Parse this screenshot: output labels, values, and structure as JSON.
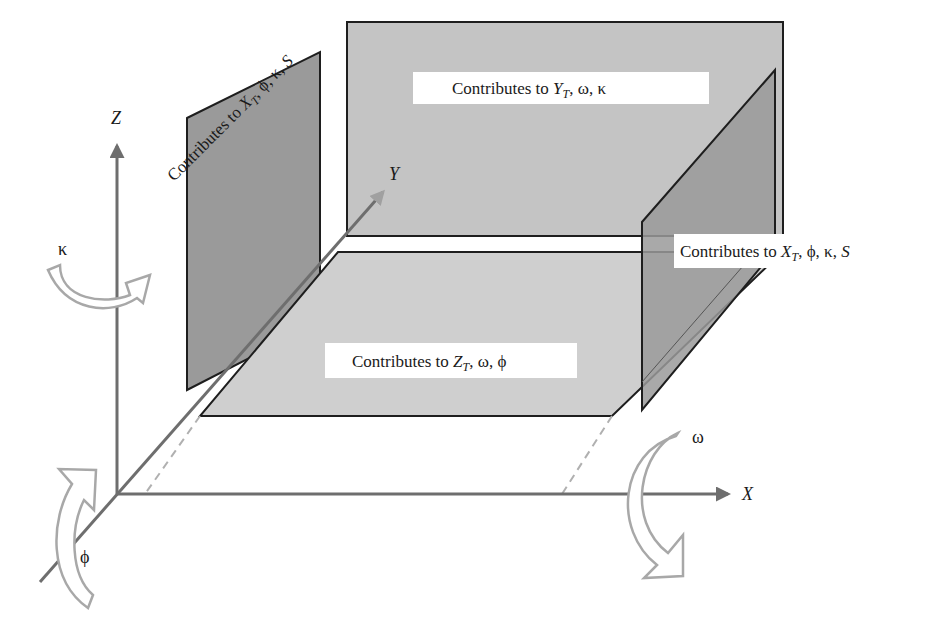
{
  "axes": {
    "z": {
      "label": "Z"
    },
    "y": {
      "label": "Y"
    },
    "x": {
      "label": "X"
    }
  },
  "rotations": {
    "kappa": {
      "symbol": "κ",
      "axis": "Z"
    },
    "phi": {
      "symbol": "ϕ",
      "axis": "Y"
    },
    "omega": {
      "symbol": "ω",
      "axis": "X"
    }
  },
  "planes": {
    "back": {
      "prefix": "Contributes to ",
      "var": "Y",
      "sub": "T",
      "suffix": ", ω, κ"
    },
    "left": {
      "prefix": "Contributes to ",
      "var": "X",
      "sub": "T",
      "suffix": ", ϕ, κ, ",
      "tail": "S"
    },
    "right": {
      "prefix": "Contributes to ",
      "var": "X",
      "sub": "T",
      "suffix": ", ϕ, κ, ",
      "tail": "S"
    },
    "floor": {
      "prefix": "Contributes to ",
      "var": "Z",
      "sub": "T",
      "suffix": ", ω, ϕ"
    }
  },
  "colors": {
    "axis": "#6e6e6e",
    "back_plane": "#c4c4c4",
    "floor_plane": "#cfcfcf",
    "side_plane": "#9a9a9a",
    "outline": "#1e1e1e",
    "rotation_arrow": "#a8a8a8"
  }
}
